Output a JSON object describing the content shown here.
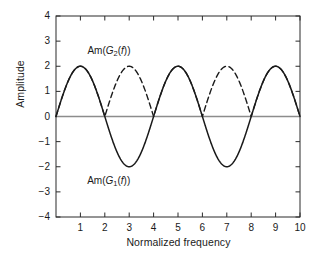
{
  "chart_data": {
    "type": "line",
    "title": "",
    "xlabel": "Normalized frequency",
    "ylabel": "Amplitude",
    "xlim": [
      0,
      10
    ],
    "ylim": [
      -4,
      4
    ],
    "grid": false,
    "legend_position": "inline-annotation",
    "xticks": [
      "1",
      "2",
      "3",
      "4",
      "5",
      "6",
      "7",
      "8",
      "9",
      "10"
    ],
    "xtick_values": [
      1,
      2,
      3,
      4,
      5,
      6,
      7,
      8,
      9,
      10
    ],
    "yticks": [
      "4",
      "3",
      "2",
      "1",
      "0",
      "-1",
      "-2",
      "-3",
      "-4"
    ],
    "ytick_values": [
      4,
      3,
      2,
      1,
      0,
      -1,
      -2,
      -3,
      -4
    ],
    "zero_line": true,
    "zero_line_color": "#8c8c8c",
    "series": [
      {
        "name": "Am(G1(f))",
        "label_html": "Am(<i>G</i><sub>1</sub>(<i>f</i>))",
        "style": "solid",
        "color": "#1a1a1a",
        "formula": "2*sin(pi*f/2)",
        "period": 4,
        "amplitude": 2,
        "x": [
          0,
          1,
          2,
          3,
          4,
          5,
          6,
          7,
          8,
          9,
          10
        ],
        "values": [
          0,
          2,
          0,
          -2,
          0,
          2,
          0,
          -2,
          0,
          2,
          0
        ],
        "annotation_x": 3.0,
        "annotation_y": -2.55
      },
      {
        "name": "Am(G2(f))",
        "label_html": "Am(<i>G</i><sub>2</sub>(<i>f</i>))",
        "style": "dashed",
        "color": "#1a1a1a",
        "formula": "2*|sin(pi*f/2)|",
        "period": 2,
        "amplitude": 2,
        "x": [
          0,
          1,
          2,
          3,
          4,
          5,
          6,
          7,
          8,
          9,
          10
        ],
        "values": [
          0,
          2,
          0,
          2,
          0,
          2,
          0,
          2,
          0,
          2,
          0
        ],
        "annotation_x": 3.05,
        "annotation_y": 2.62
      }
    ]
  }
}
